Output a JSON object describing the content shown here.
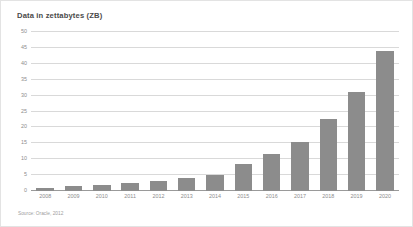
{
  "figure": {
    "title": "Data in zettabytes (ZB)",
    "source_note": "Source: Oracle, 2012",
    "background_color": "#ffffff",
    "border_color": "#e3e3e3",
    "bar_color": "#8c8c8c",
    "gridline_color": "#d9d9d9",
    "axis_color": "#9a9a9a",
    "text_color": "#8d8d8d",
    "title_color": "#4a4a4a"
  },
  "chart_data": {
    "type": "bar",
    "title": "Data in zettabytes (ZB)",
    "xlabel": "",
    "ylabel": "",
    "categories": [
      "2008",
      "2009",
      "2010",
      "2011",
      "2012",
      "2013",
      "2014",
      "2015",
      "2016",
      "2017",
      "2018",
      "2019",
      "2020"
    ],
    "values": [
      1,
      1.5,
      2,
      2.5,
      3,
      4,
      5,
      8.5,
      11.5,
      15.5,
      22.5,
      31,
      44
    ],
    "ylim": [
      0,
      50
    ],
    "yticks": [
      0,
      5,
      10,
      15,
      20,
      25,
      30,
      35,
      40,
      45,
      50
    ],
    "ytick_labels": [
      "0",
      "5",
      "10",
      "15",
      "20",
      "25",
      "30",
      "35",
      "40",
      "45",
      "50"
    ],
    "grid": true,
    "legend": false,
    "series": [
      {
        "name": "Data in zettabytes (ZB)",
        "values": [
          1,
          1.5,
          2,
          2.5,
          3,
          4,
          5,
          8.5,
          11.5,
          15.5,
          22.5,
          31,
          44
        ]
      }
    ]
  }
}
